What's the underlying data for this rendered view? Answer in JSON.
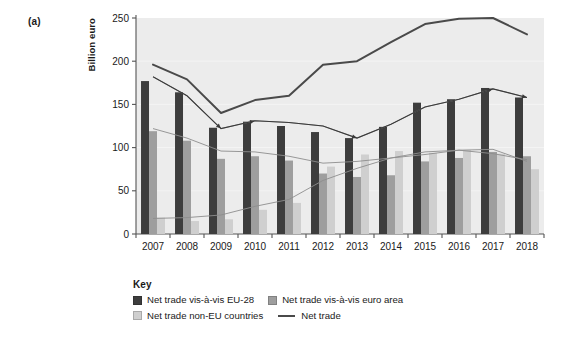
{
  "figure": {
    "panel_label": "(a)",
    "y_axis_title": "Billion euro"
  },
  "legend": {
    "title": "Key",
    "entries": [
      {
        "label": "Net trade vis-à-vis EU-28",
        "marker": "square-swatch",
        "color": "#3d3d3d"
      },
      {
        "label": "Net trade vis-à-vis euro area",
        "marker": "square-swatch",
        "color": "#9e9e9e"
      },
      {
        "label": "Net trade non-EU countries",
        "marker": "square-swatch",
        "color": "#cfcfcf"
      },
      {
        "label": "Net trade",
        "marker": "line-swatch",
        "color": "#4a4a4a"
      }
    ]
  },
  "chart_data": {
    "type": "bar",
    "title": "",
    "xlabel": "",
    "ylabel": "Billion euro",
    "ylim": [
      0,
      250
    ],
    "yticks": [
      0,
      50,
      100,
      150,
      200,
      250
    ],
    "ytick_labels": [
      "0",
      "50",
      "100",
      "150",
      "200",
      "250"
    ],
    "grid": false,
    "legend_position": "below",
    "categories": [
      "2007",
      "2008",
      "2009",
      "2010",
      "2011",
      "2012",
      "2013",
      "2014",
      "2015",
      "2016",
      "2017",
      "2018"
    ],
    "series": [
      {
        "name": "Net trade vis-à-vis EU-28",
        "kind": "bar",
        "color": "#3d3d3d",
        "values": [
          177,
          164,
          123,
          130,
          125,
          118,
          111,
          124,
          152,
          156,
          169,
          158
        ]
      },
      {
        "name": "Net trade vis-à-vis euro area",
        "kind": "bar",
        "color": "#9e9e9e",
        "values": [
          119,
          108,
          87,
          90,
          85,
          70,
          66,
          68,
          84,
          88,
          95,
          90
        ]
      },
      {
        "name": "Net trade non-EU countries",
        "kind": "bar",
        "color": "#cfcfcf",
        "values": [
          19,
          15,
          17,
          28,
          36,
          78,
          92,
          96,
          94,
          97,
          93,
          75
        ]
      },
      {
        "name": "Net trade",
        "kind": "line",
        "color": "#4a4a4a",
        "values": [
          196,
          179,
          140,
          155,
          160,
          196,
          200,
          222,
          243,
          249,
          250,
          231
        ]
      }
    ],
    "annotation_lines": [
      {
        "name": "eu28-trend-arrow",
        "values": [
          182,
          160,
          122,
          131,
          129,
          125,
          111,
          127,
          147,
          156,
          168,
          158
        ],
        "arrow_at": [
          2,
          3,
          6,
          10,
          11
        ]
      },
      {
        "name": "euro-area-trend",
        "values": [
          122,
          111,
          96,
          95,
          90,
          82,
          84,
          88,
          95,
          97,
          93,
          86
        ]
      },
      {
        "name": "non-eu-trend",
        "values": [
          18,
          19,
          22,
          32,
          40,
          62,
          76,
          88,
          92,
          97,
          98,
          84
        ]
      }
    ]
  }
}
